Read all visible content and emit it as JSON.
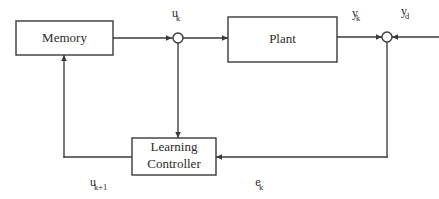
{
  "diagram": {
    "background_color": "#ffffff",
    "line_color": "#3a3a3a",
    "text_color": "#2b2b2b",
    "blocks": [
      {
        "id": "memory",
        "label": "Memory",
        "x": 16,
        "y": 21,
        "width": 97,
        "height": 34
      },
      {
        "id": "plant",
        "label": "Plant",
        "x": 228,
        "y": 17,
        "width": 109,
        "height": 45
      },
      {
        "id": "controller",
        "label_line1": "Learning",
        "label_line2": "Controller",
        "x": 132,
        "y": 138,
        "width": 84,
        "height": 37
      }
    ],
    "junctions": [
      {
        "id": "u-junction",
        "cx": 178,
        "cy": 38,
        "r": 5
      },
      {
        "id": "y-junction",
        "cx": 387,
        "cy": 37,
        "r": 5
      }
    ],
    "signals": [
      {
        "id": "u-k",
        "base": "u",
        "subscript": "k",
        "x": 178,
        "y": 17
      },
      {
        "id": "y-k",
        "base": "y",
        "subscript": "k",
        "x": 355,
        "y": 17
      },
      {
        "id": "y-d",
        "base": "y",
        "subscript": "d",
        "x": 404,
        "y": 15
      },
      {
        "id": "e-k",
        "base": "e",
        "subscript": "k",
        "x": 258,
        "y": 186
      },
      {
        "id": "u-k-plus-1",
        "base": "u",
        "subscript": "k+1",
        "x": 93,
        "y": 186
      }
    ]
  }
}
